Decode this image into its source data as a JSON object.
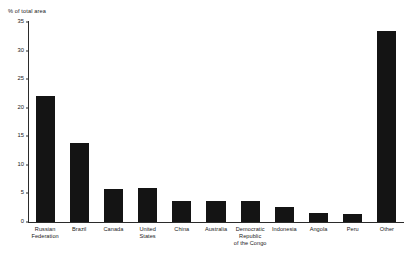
{
  "chart_data": {
    "type": "bar",
    "title": "",
    "subtitle": "",
    "xlabel": "",
    "ylabel": "% of total area",
    "ylim": [
      0,
      35
    ],
    "ytick_values": [
      0,
      5,
      10,
      15,
      20,
      25,
      30,
      35
    ],
    "ytick_labels": [
      "0",
      "5",
      "10",
      "15",
      "20",
      "25",
      "30",
      "35"
    ],
    "grid": false,
    "legend": null,
    "legend_position": "none",
    "categories": [
      "Russian Federation",
      "Brazil",
      "Canada",
      "United States",
      "China",
      "Australia",
      "Democratic Republic of the Congo",
      "Indonesia",
      "Angola",
      "Peru",
      "Other"
    ],
    "category_label_lines": [
      [
        "Russian",
        "Federation"
      ],
      [
        "Brazil"
      ],
      [
        "Canada"
      ],
      [
        "United",
        "States"
      ],
      [
        "China"
      ],
      [
        "Australia"
      ],
      [
        "Democratic",
        "Republic",
        "of the Congo"
      ],
      [
        "Indonesia"
      ],
      [
        "Angola"
      ],
      [
        "Peru"
      ],
      [
        "Other"
      ]
    ],
    "values": [
      22.0,
      13.8,
      5.8,
      5.9,
      3.7,
      3.6,
      3.6,
      2.6,
      1.6,
      1.4,
      33.5
    ],
    "bar_color": "#141414",
    "axis_color": "#2b2b2b",
    "background_color": "#ffffff",
    "text_color": "#1a1a1a"
  }
}
